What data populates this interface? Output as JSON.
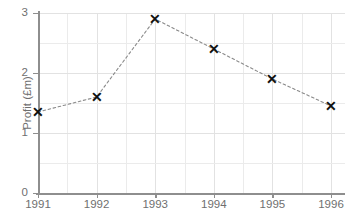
{
  "chart_data": {
    "type": "line",
    "title": "",
    "xlabel": "",
    "ylabel": "Profit (£m)",
    "categories": [
      "1991",
      "1992",
      "1993",
      "1994",
      "1995",
      "1996"
    ],
    "x": [
      1991,
      1992,
      1993,
      1994,
      1995,
      1996
    ],
    "values": [
      1.35,
      1.6,
      2.9,
      2.4,
      1.9,
      1.45
    ],
    "series": [
      {
        "name": "Profit",
        "values": [
          1.35,
          1.6,
          2.9,
          2.4,
          1.9,
          1.45
        ]
      }
    ],
    "xlim": [
      1991,
      1996
    ],
    "ylim": [
      0,
      3
    ],
    "ytick_labels": [
      "0",
      "1",
      "2",
      "3"
    ],
    "ytick_values": [
      0,
      1,
      2,
      3
    ],
    "xtick_labels": [
      "1991",
      "1992",
      "1993",
      "1994",
      "1995",
      "1996"
    ],
    "grid": true,
    "grid_minor_y": [
      0.5,
      1.5,
      2.5
    ],
    "legend": false,
    "legend_position": "none",
    "marker_symbol": "✕",
    "line_style": "dotted",
    "colors": {
      "marker": "#101010",
      "line": "#8a8a8a",
      "grid_major": "#e2e2e2",
      "grid_minor": "#ebebeb",
      "axis": "#8e8e8e",
      "tick_text": "#6f6f6f",
      "background": "#ffffff"
    }
  }
}
